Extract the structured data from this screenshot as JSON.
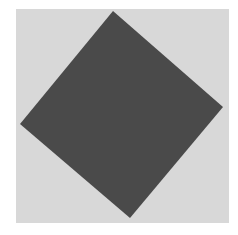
{
  "figure": {
    "background_color": "#d8d8d8",
    "shape": {
      "type": "rotated-square",
      "fill": "#4a4a4a",
      "vertices": [
        [
          113,
          11
        ],
        [
          223,
          107
        ],
        [
          130,
          218
        ],
        [
          20,
          124
        ]
      ]
    }
  }
}
